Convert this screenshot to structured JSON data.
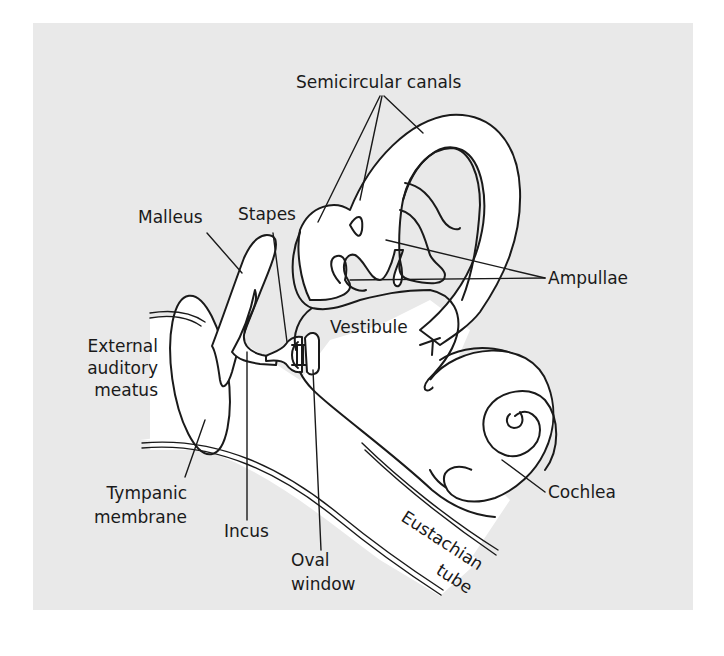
{
  "diagram": {
    "colors": {
      "background": "#ffffff",
      "panel": "#e9e9e9",
      "line": "#1a1a1a",
      "structure_fill": "#ffffff"
    },
    "labels": {
      "semicircular_canals": "Semicircular canals",
      "malleus": "Malleus",
      "stapes": "Stapes",
      "ampullae": "Ampullae",
      "vestibule": "Vestibule",
      "external_line1": "External",
      "external_line2": "auditory",
      "external_line3": "meatus",
      "cochlea": "Cochlea",
      "tympanic_line1": "Tympanic",
      "tympanic_line2": "membrane",
      "incus": "Incus",
      "oval_line1": "Oval",
      "oval_line2": "window",
      "eustachian_line1": "Eustachian",
      "eustachian_line2": "tube"
    }
  }
}
